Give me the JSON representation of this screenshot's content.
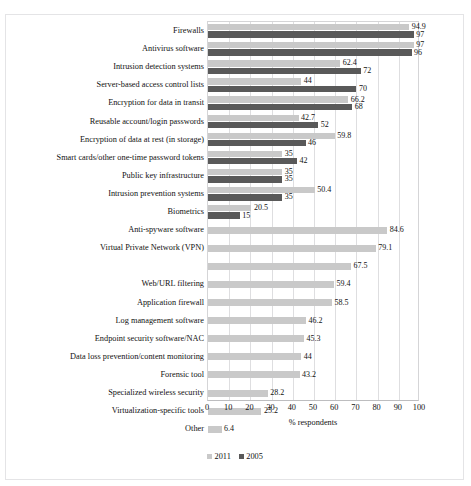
{
  "scan": {
    "artifact_text": ""
  },
  "chart_data": {
    "type": "bar",
    "orientation": "horizontal",
    "title": "",
    "xlabel": "% respondents",
    "ylabel": "",
    "xlim": [
      0,
      100
    ],
    "xticks": [
      0,
      10,
      20,
      30,
      40,
      50,
      60,
      70,
      80,
      90,
      100
    ],
    "grid": true,
    "legend_position": "bottom-left",
    "colors": {
      "2011": "#c9c9c9",
      "2005": "#595959"
    },
    "legend": [
      "2011",
      "2005"
    ],
    "categories": [
      "Firewalls",
      "Antivirus software",
      "Intrusion detection systems",
      "Server-based access control lists",
      "Encryption for data in transit",
      "Reusable account/login passwords",
      "Encryption of data at rest (in storage)",
      "Smart cards/other one-time password tokens",
      "Public key infrastructure",
      "Intrusion prevention systems",
      "Biometrics",
      "Anti-spyware software",
      "Virtual Private Network (VPN)",
      "",
      "Web/URL filtering",
      "Application firewall",
      "Log management software",
      "Endpoint security software/NAC",
      "Data loss prevention/content monitoring",
      "Forensic tool",
      "Specialized wireless security",
      "Virtualization-specific tools",
      "Other"
    ],
    "series": [
      {
        "name": "2011",
        "values": [
          94.9,
          97,
          62.4,
          44,
          66.2,
          42.7,
          59.8,
          35,
          35,
          50.4,
          20.5,
          84.6,
          79.1,
          67.5,
          59.4,
          58.5,
          46.2,
          45.3,
          44,
          43.2,
          28.2,
          25.2,
          6.4
        ]
      },
      {
        "name": "2005",
        "values": [
          97,
          96,
          72,
          70,
          68,
          52,
          46,
          42,
          35,
          35,
          15,
          null,
          null,
          null,
          null,
          null,
          null,
          null,
          null,
          null,
          null,
          null,
          null
        ]
      }
    ],
    "labels_2011": [
      "94.9",
      "97",
      "62.4",
      "44",
      "66.2",
      "42.7",
      "59.8",
      "35",
      "35",
      "50.4",
      "20.5",
      "84.6",
      "79.1",
      "67.5",
      "59.4",
      "58.5",
      "46.2",
      "45.3",
      "44",
      "43.2",
      "28.2",
      "25.2",
      "6.4"
    ],
    "labels_2005": [
      "97",
      "96",
      "72",
      "70",
      "68",
      "52",
      "46",
      "42",
      "35",
      "35",
      "15",
      "",
      "",
      "",
      "",
      "",
      "",
      "",
      "",
      "",
      "",
      "",
      ""
    ]
  }
}
